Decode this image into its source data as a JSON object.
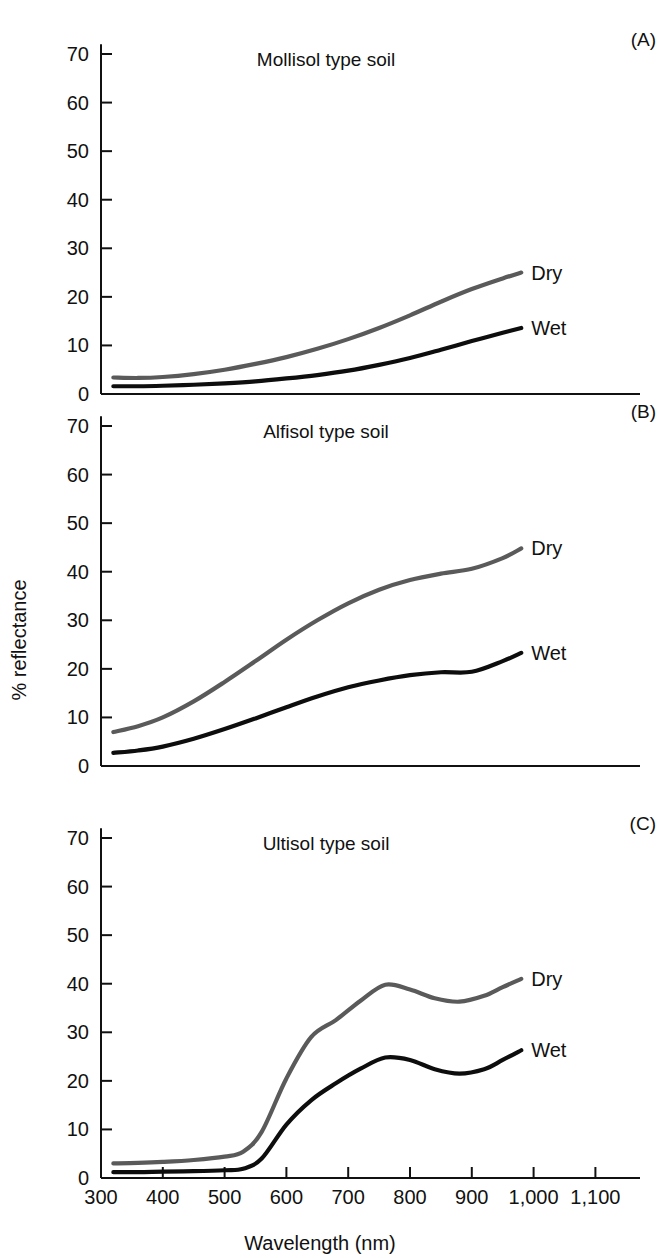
{
  "figure": {
    "xlabel": "Wavelength (nm)",
    "ylabel": "% reflectance",
    "series_names": [
      "Dry",
      "Wet"
    ],
    "colors": {
      "dry": "#5a5a5a",
      "wet": "#0d0d0d",
      "axis": "#111111",
      "background": "#ffffff"
    },
    "x_ticks": [
      "300",
      "400",
      "500",
      "600",
      "700",
      "800",
      "900",
      "1,000",
      "1,100"
    ],
    "x_tick_values": [
      300,
      400,
      500,
      600,
      700,
      800,
      900,
      1000,
      1100
    ],
    "y_ticks": [
      "0",
      "10",
      "20",
      "30",
      "40",
      "50",
      "60",
      "70"
    ],
    "y_tick_values": [
      0,
      10,
      20,
      30,
      40,
      50,
      60,
      70
    ],
    "panels": [
      {
        "tag": "(A)",
        "title": "Mollisol type soil"
      },
      {
        "tag": "(B)",
        "title": "Alfisol type soil"
      },
      {
        "tag": "(C)",
        "title": "Ultisol type soil"
      }
    ]
  },
  "chart_data": [
    {
      "type": "line",
      "panel": "(A)",
      "title": "Mollisol type soil",
      "xlabel": "Wavelength (nm)",
      "ylabel": "% reflectance",
      "xlim": [
        300,
        1150
      ],
      "ylim": [
        0,
        72
      ],
      "grid": false,
      "legend": "inline-right-end-of-curve",
      "x": [
        320,
        360,
        400,
        450,
        500,
        550,
        600,
        650,
        700,
        750,
        800,
        850,
        900,
        950,
        980
      ],
      "series": [
        {
          "name": "Dry",
          "color": "#5a5a5a",
          "values": [
            3.4,
            3.3,
            3.5,
            4.1,
            5.0,
            6.2,
            7.6,
            9.3,
            11.3,
            13.6,
            16.2,
            19.0,
            21.6,
            23.8,
            25.0
          ]
        },
        {
          "name": "Wet",
          "color": "#0d0d0d",
          "values": [
            1.6,
            1.6,
            1.7,
            1.9,
            2.2,
            2.6,
            3.2,
            3.9,
            4.8,
            6.0,
            7.4,
            9.1,
            10.9,
            12.6,
            13.6
          ]
        }
      ]
    },
    {
      "type": "line",
      "panel": "(B)",
      "title": "Alfisol type soil",
      "xlabel": "Wavelength (nm)",
      "ylabel": "% reflectance",
      "xlim": [
        300,
        1150
      ],
      "ylim": [
        0,
        72
      ],
      "grid": false,
      "legend": "inline-right-end-of-curve",
      "x": [
        320,
        360,
        400,
        450,
        500,
        550,
        600,
        650,
        700,
        750,
        800,
        850,
        900,
        950,
        980
      ],
      "series": [
        {
          "name": "Dry",
          "color": "#5a5a5a",
          "values": [
            7.0,
            8.2,
            10.0,
            13.3,
            17.3,
            21.6,
            26.0,
            30.0,
            33.5,
            36.3,
            38.3,
            39.6,
            40.6,
            42.8,
            44.8
          ]
        },
        {
          "name": "Wet",
          "color": "#0d0d0d",
          "values": [
            2.7,
            3.2,
            4.0,
            5.6,
            7.6,
            9.8,
            12.1,
            14.3,
            16.2,
            17.6,
            18.7,
            19.3,
            19.4,
            21.6,
            23.3
          ]
        }
      ]
    },
    {
      "type": "line",
      "panel": "(C)",
      "title": "Ultisol type soil",
      "xlabel": "Wavelength (nm)",
      "ylabel": "% reflectance",
      "xlim": [
        300,
        1150
      ],
      "ylim": [
        0,
        72
      ],
      "grid": false,
      "legend": "inline-right-end-of-curve",
      "x": [
        320,
        360,
        400,
        450,
        500,
        530,
        560,
        600,
        640,
        680,
        720,
        760,
        800,
        840,
        880,
        920,
        950,
        980
      ],
      "series": [
        {
          "name": "Dry",
          "color": "#5a5a5a",
          "values": [
            3.0,
            3.1,
            3.3,
            3.7,
            4.4,
            5.4,
            9.5,
            20.5,
            29.0,
            32.5,
            36.5,
            39.8,
            38.8,
            37.0,
            36.3,
            37.5,
            39.3,
            41.0
          ]
        },
        {
          "name": "Wet",
          "color": "#0d0d0d",
          "values": [
            1.2,
            1.2,
            1.3,
            1.4,
            1.6,
            1.9,
            4.0,
            11.0,
            16.0,
            19.5,
            22.5,
            24.8,
            24.3,
            22.4,
            21.5,
            22.4,
            24.3,
            26.3
          ]
        }
      ]
    }
  ]
}
